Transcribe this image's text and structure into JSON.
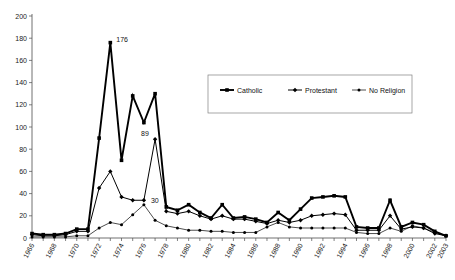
{
  "chart_data": {
    "type": "line",
    "title": "",
    "subtitle": "",
    "xlabel": "",
    "ylabel": "",
    "ylim": [
      0,
      200
    ],
    "ytick_step": 20,
    "yticks": [
      0,
      20,
      40,
      60,
      80,
      100,
      120,
      140,
      160,
      180,
      200
    ],
    "grid": false,
    "legend_position": "top-right-inside",
    "x": [
      1966,
      1967,
      1968,
      1969,
      1970,
      1971,
      1972,
      1973,
      1974,
      1975,
      1976,
      1977,
      1978,
      1979,
      1980,
      1981,
      1982,
      1983,
      1984,
      1985,
      1986,
      1987,
      1988,
      1989,
      1990,
      1991,
      1992,
      1993,
      1994,
      1995,
      1996,
      1997,
      1998,
      1999,
      2000,
      2001,
      2002,
      2003
    ],
    "xtick_labels": [
      "1966",
      "1968",
      "1970",
      "1972",
      "1974",
      "1976",
      "1978",
      "1980",
      "1982",
      "1984",
      "1986",
      "1988",
      "1990",
      "1992",
      "1994",
      "1996",
      "1998",
      "2000",
      "2002",
      "2003"
    ],
    "xtick_values": [
      1966,
      1968,
      1970,
      1972,
      1974,
      1976,
      1978,
      1980,
      1982,
      1984,
      1986,
      1988,
      1990,
      1992,
      1994,
      1996,
      1998,
      2000,
      2002,
      2003
    ],
    "series": [
      {
        "name": "Catholic",
        "marker": "square",
        "line_weight": "thick",
        "color": "#000000",
        "values": [
          4,
          3,
          3,
          4,
          8,
          8,
          90,
          176,
          70,
          128,
          104,
          130,
          28,
          25,
          30,
          23,
          18,
          30,
          18,
          19,
          17,
          14,
          23,
          16,
          26,
          36,
          37,
          38,
          37,
          10,
          9,
          9,
          34,
          10,
          14,
          12,
          6,
          2
        ]
      },
      {
        "name": "Protestant",
        "marker": "diamond",
        "line_weight": "medium",
        "color": "#000000",
        "values": [
          3,
          2,
          2,
          3,
          6,
          6,
          45,
          60,
          37,
          34,
          34,
          89,
          24,
          22,
          24,
          20,
          17,
          20,
          17,
          17,
          15,
          13,
          16,
          14,
          16,
          20,
          21,
          22,
          21,
          7,
          7,
          7,
          20,
          8,
          10,
          9,
          4,
          2
        ]
      },
      {
        "name": "No Religion",
        "marker": "dot",
        "line_weight": "thin",
        "color": "#000000",
        "values": [
          1,
          1,
          1,
          1,
          2,
          2,
          9,
          14,
          12,
          21,
          30,
          16,
          11,
          9,
          7,
          7,
          6,
          6,
          5,
          5,
          5,
          10,
          14,
          10,
          9,
          9,
          9,
          9,
          9,
          5,
          4,
          4,
          9,
          6,
          11,
          9,
          5,
          2
        ]
      }
    ],
    "annotations": [
      {
        "text": "176",
        "series": "Catholic",
        "x": 1973,
        "y": 176
      },
      {
        "text": "89",
        "series": "Protestant",
        "x": 1977,
        "y": 89
      },
      {
        "text": "30",
        "series": "No Religion",
        "x": 1976,
        "y": 30
      }
    ]
  }
}
